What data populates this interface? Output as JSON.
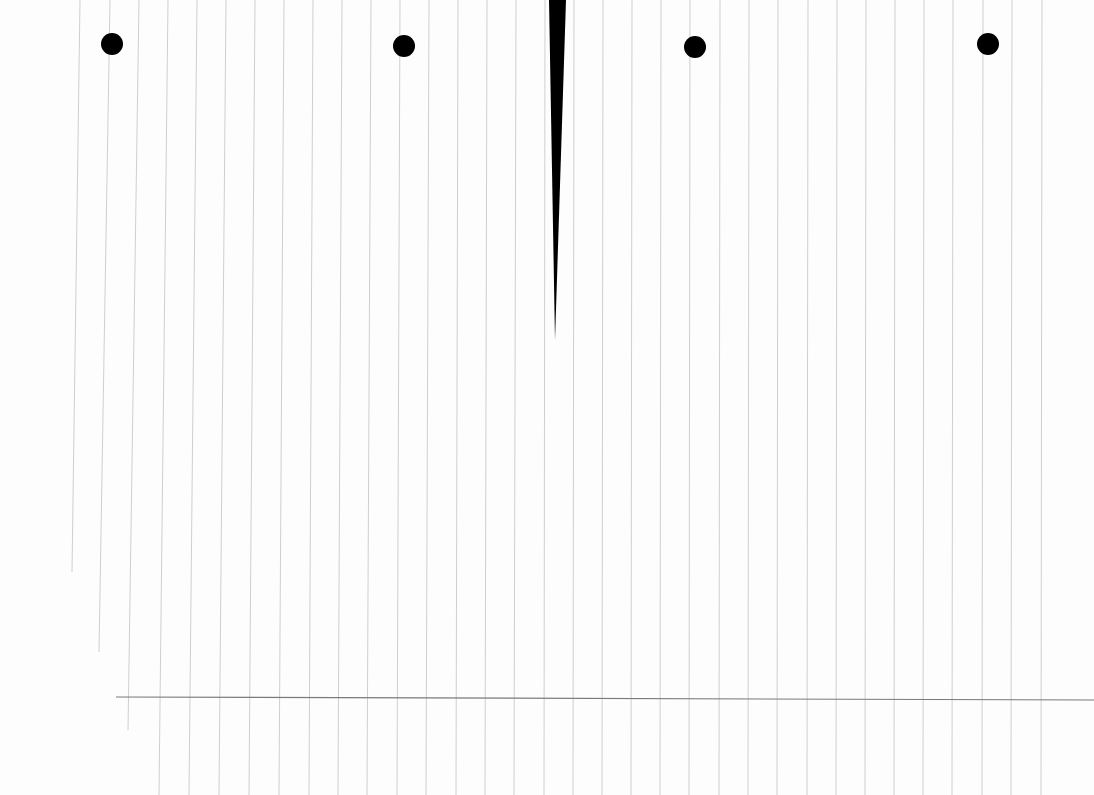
{
  "page": {
    "kind": "scanned lined notebook paper (rotated)",
    "background": "#fdfdfd",
    "rule_color": "#cfcfcf",
    "margin_line_color": "#7a7a7a",
    "mark_color": "#000000"
  },
  "rules": [
    {
      "x1": 80,
      "y1": 0,
      "x2": 72,
      "y2": 572
    },
    {
      "x1": 110,
      "y1": 0,
      "x2": 99,
      "y2": 652
    },
    {
      "x1": 139,
      "y1": 0,
      "x2": 128,
      "y2": 730
    },
    {
      "x1": 168,
      "y1": 0,
      "x2": 159,
      "y2": 795
    },
    {
      "x1": 197,
      "y1": 0,
      "x2": 189,
      "y2": 795
    },
    {
      "x1": 226,
      "y1": 0,
      "x2": 219,
      "y2": 795
    },
    {
      "x1": 255,
      "y1": 0,
      "x2": 249,
      "y2": 795
    },
    {
      "x1": 284,
      "y1": 0,
      "x2": 279,
      "y2": 795
    },
    {
      "x1": 313,
      "y1": 0,
      "x2": 309,
      "y2": 795
    },
    {
      "x1": 342,
      "y1": 0,
      "x2": 338,
      "y2": 795
    },
    {
      "x1": 371,
      "y1": 0,
      "x2": 367,
      "y2": 795
    },
    {
      "x1": 400,
      "y1": 0,
      "x2": 397,
      "y2": 795
    },
    {
      "x1": 429,
      "y1": 0,
      "x2": 426,
      "y2": 795
    },
    {
      "x1": 458,
      "y1": 0,
      "x2": 456,
      "y2": 795
    },
    {
      "x1": 487,
      "y1": 0,
      "x2": 485,
      "y2": 795
    },
    {
      "x1": 516,
      "y1": 0,
      "x2": 514,
      "y2": 795
    },
    {
      "x1": 545,
      "y1": 0,
      "x2": 544,
      "y2": 795
    },
    {
      "x1": 574,
      "y1": 0,
      "x2": 573,
      "y2": 795
    },
    {
      "x1": 603,
      "y1": 0,
      "x2": 602,
      "y2": 795
    },
    {
      "x1": 632,
      "y1": 0,
      "x2": 631,
      "y2": 795
    },
    {
      "x1": 661,
      "y1": 0,
      "x2": 660,
      "y2": 795
    },
    {
      "x1": 690,
      "y1": 0,
      "x2": 689,
      "y2": 795
    },
    {
      "x1": 720,
      "y1": 0,
      "x2": 719,
      "y2": 795
    },
    {
      "x1": 749,
      "y1": 0,
      "x2": 748,
      "y2": 795
    },
    {
      "x1": 778,
      "y1": 0,
      "x2": 777,
      "y2": 795
    },
    {
      "x1": 808,
      "y1": 0,
      "x2": 807,
      "y2": 795
    },
    {
      "x1": 837,
      "y1": 0,
      "x2": 836,
      "y2": 795
    },
    {
      "x1": 866,
      "y1": 0,
      "x2": 865,
      "y2": 795
    },
    {
      "x1": 895,
      "y1": 0,
      "x2": 894,
      "y2": 795
    },
    {
      "x1": 924,
      "y1": 0,
      "x2": 923,
      "y2": 795
    },
    {
      "x1": 953,
      "y1": 0,
      "x2": 952,
      "y2": 795
    },
    {
      "x1": 983,
      "y1": 0,
      "x2": 982,
      "y2": 795
    },
    {
      "x1": 1012,
      "y1": 0,
      "x2": 1011,
      "y2": 795
    },
    {
      "x1": 1042,
      "y1": 0,
      "x2": 1041,
      "y2": 795
    }
  ],
  "margin_line": {
    "x1": 116,
    "y1": 697,
    "x2": 1094,
    "y2": 700
  },
  "holes": [
    {
      "cx": 112,
      "cy": 44,
      "r": 11
    },
    {
      "cx": 404,
      "cy": 46,
      "r": 11
    },
    {
      "cx": 695,
      "cy": 47,
      "r": 11
    },
    {
      "cx": 988,
      "cy": 44,
      "r": 11
    }
  ],
  "wedge": {
    "points": "549,0 566,0 555,340"
  }
}
